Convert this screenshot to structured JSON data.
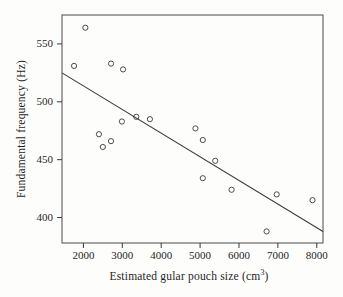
{
  "figure": {
    "background": "#fdfdfc"
  },
  "chart_data": {
    "type": "scatter",
    "title": "",
    "xlabel": "Estimated gular pouch size (cm³)",
    "xlabel_pre": "Estimated gular pouch size (cm",
    "xlabel_sup": "3",
    "xlabel_post": ")",
    "ylabel": "Fundamental frequency (Hz)",
    "x_ticks": [
      2000,
      3000,
      4000,
      5000,
      6000,
      7000,
      8000
    ],
    "y_ticks": [
      400,
      450,
      500,
      550
    ],
    "xlim": [
      1450,
      8160
    ],
    "ylim": [
      378,
      575
    ],
    "grid": false,
    "legend": null,
    "points": [
      {
        "x": 2050,
        "y": 564
      },
      {
        "x": 1760,
        "y": 531
      },
      {
        "x": 2710,
        "y": 533
      },
      {
        "x": 3020,
        "y": 528
      },
      {
        "x": 2400,
        "y": 472
      },
      {
        "x": 2500,
        "y": 461
      },
      {
        "x": 2710,
        "y": 466
      },
      {
        "x": 2990,
        "y": 483
      },
      {
        "x": 3360,
        "y": 487
      },
      {
        "x": 3710,
        "y": 485
      },
      {
        "x": 4880,
        "y": 477
      },
      {
        "x": 5070,
        "y": 467
      },
      {
        "x": 5390,
        "y": 449
      },
      {
        "x": 5070,
        "y": 434
      },
      {
        "x": 5810,
        "y": 424
      },
      {
        "x": 6970,
        "y": 420
      },
      {
        "x": 7890,
        "y": 415
      },
      {
        "x": 6710,
        "y": 388
      }
    ],
    "trend_line": {
      "x1": 1450,
      "y1": 525,
      "x2": 8160,
      "y2": 388
    },
    "marker": {
      "shape": "open-circle",
      "radius": 2.6
    },
    "colors": {
      "frame": "#4a4a4a",
      "tick": "#3a3a3a",
      "tick_label": "#1f1f1f",
      "point_stroke": "#3a3a3a",
      "trend_line": "#3a3a3a"
    }
  }
}
